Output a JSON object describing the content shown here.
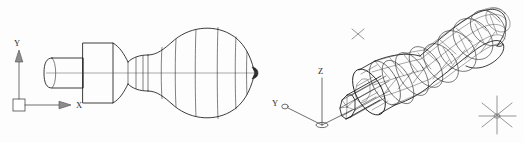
{
  "document": {
    "title": "Revolved Solid — Two Viewports",
    "background_color": "#fdfdfd",
    "line_color": "#1a1a1a",
    "ucs_color": "#4a4a4a",
    "width": 524,
    "height": 143
  },
  "viewports": [
    {
      "id": "left-viewport",
      "name": "plan-wireframe-view",
      "view_type": "2D orthographic wireframe",
      "ucs_icon": {
        "style": "2D square UCS icon",
        "origin_marker": "square",
        "axes": [
          {
            "name": "x-axis",
            "label": "X",
            "direction": "right",
            "arrow": "filled-triangle"
          },
          {
            "name": "y-axis",
            "label": "Y",
            "direction": "up",
            "arrow": "filled-triangle"
          }
        ]
      },
      "model": {
        "name": "screwdriver-profile",
        "description": "revolved solid profile: rounded shaft stub, square collar, concave waist, bulbous handle, pointed cap",
        "isolines_visible": true,
        "centerline_visible": true
      }
    },
    {
      "id": "right-viewport",
      "name": "isometric-mesh-view",
      "view_type": "3D isometric wireframe mesh",
      "ucs_icon": {
        "style": "3D broken-pencil UCS icon",
        "origin_marker": "ellipse",
        "axes": [
          {
            "name": "x-axis",
            "label": "X",
            "direction": "lower-right",
            "arrow": "none"
          },
          {
            "name": "y-axis",
            "label": "Y",
            "direction": "lower-left",
            "arrow": "ellipse-marker"
          },
          {
            "name": "z-axis",
            "label": "Z",
            "direction": "up",
            "arrow": "none"
          }
        ]
      },
      "model": {
        "name": "screwdriver-mesh",
        "description": "triangulated revolved surface mesh of the same screwdriver body",
        "mesh_visible": true
      },
      "markers": [
        {
          "name": "blip-marker-upper",
          "glyph": "x",
          "x": 358,
          "y": 34
        },
        {
          "name": "blip-marker-right",
          "glyph": "asterisk",
          "x": 497,
          "y": 115
        }
      ]
    }
  ],
  "labels": {
    "left_x": "X",
    "left_y": "Y",
    "right_x": "X",
    "right_y": "Y",
    "right_z": "Z"
  }
}
